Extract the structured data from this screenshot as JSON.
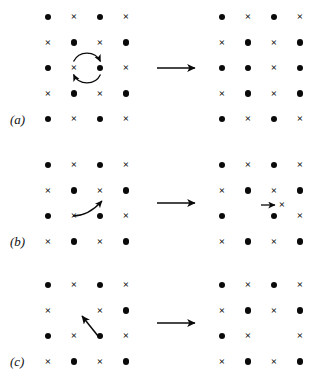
{
  "figure": {
    "background_color": "#ffffff",
    "ink_color": "#0a0a0a",
    "symbol_legend": {
      "dot": "filled-circle-atom",
      "cross": "cross-atom",
      "vacancy": "empty-lattice-site"
    },
    "transition_arrow_icon": "right-arrow-icon"
  },
  "panels": [
    {
      "id": "a",
      "label": "(a)",
      "mechanism_icon": "ring-exchange-arrow-icon",
      "rows": 5,
      "cols": 4,
      "before": [
        [
          "dot",
          "cross",
          "dot",
          "cross"
        ],
        [
          "cross",
          "dot",
          "cross",
          "dot"
        ],
        [
          "dot",
          "cross",
          "dot",
          "cross"
        ],
        [
          "cross",
          "dot",
          "cross",
          "dot"
        ],
        [
          "dot",
          "cross",
          "dot",
          "cross"
        ]
      ],
      "after": [
        [
          "dot",
          "cross",
          "dot",
          "cross"
        ],
        [
          "cross",
          "dot",
          "cross",
          "dot"
        ],
        [
          "dot",
          "dot",
          "cross",
          "dot"
        ],
        [
          "cross",
          "dot",
          "cross",
          "dot"
        ],
        [
          "dot",
          "cross",
          "dot",
          "cross"
        ]
      ]
    },
    {
      "id": "b",
      "label": "(b)",
      "mechanism_icon": "curved-hop-arrow-icon",
      "rows": 4,
      "cols": 4,
      "before": [
        [
          "dot",
          "cross",
          "dot",
          "cross"
        ],
        [
          "cross",
          "dot",
          "cross",
          "dot"
        ],
        [
          "dot",
          "cross",
          "dot",
          "cross"
        ],
        [
          "cross",
          "dot",
          "cross",
          "dot"
        ]
      ],
      "after": [
        [
          "dot",
          "cross",
          "dot",
          "cross"
        ],
        [
          "cross",
          "dot",
          "cross",
          "dot"
        ],
        [
          "dot",
          "vacant",
          "dot",
          "cross"
        ],
        [
          "cross",
          "dot",
          "cross",
          "dot"
        ]
      ],
      "after_interstitial_icon": "short-right-arrow-icon",
      "after_interstitial_symbol": "cross"
    },
    {
      "id": "c",
      "label": "(c)",
      "mechanism_icon": "diagonal-arrow-icon",
      "rows": 4,
      "cols": 4,
      "before": [
        [
          "dot",
          "cross",
          "dot",
          "cross"
        ],
        [
          "cross",
          "vacant",
          "cross",
          "dot"
        ],
        [
          "dot",
          "cross",
          "dot",
          "cross"
        ],
        [
          "cross",
          "dot",
          "cross",
          "dot"
        ]
      ],
      "after": [
        [
          "dot",
          "cross",
          "dot",
          "cross"
        ],
        [
          "cross",
          "dot",
          "cross",
          "dot"
        ],
        [
          "dot",
          "cross",
          "vacant",
          "cross"
        ],
        [
          "cross",
          "dot",
          "cross",
          "dot"
        ]
      ]
    }
  ]
}
